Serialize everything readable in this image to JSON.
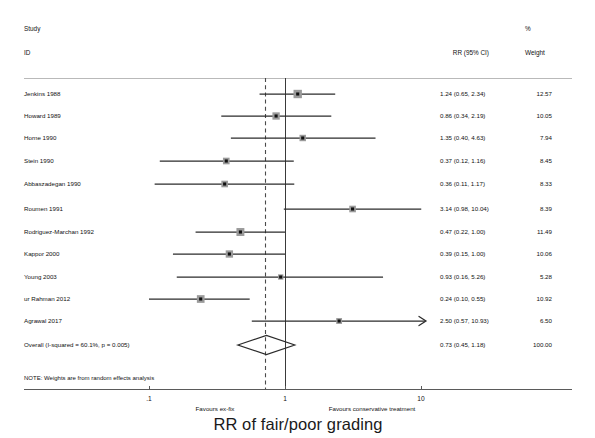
{
  "figure": {
    "title": "RR of fair/poor grading",
    "type": "forest-plot",
    "note": "NOTE: Weights are from random effects analysis",
    "top_caption": ""
  },
  "header": {
    "study_line1": "Study",
    "study_line2": "ID",
    "effect_label": "RR (95% CI)",
    "weight_line1": "%",
    "weight_line2": "Weight"
  },
  "axis": {
    "label_left": "Favours ex-fix",
    "label_right": "Favours conservative treatment",
    "scale": "log10",
    "ticks": [
      {
        "label": ".1",
        "value": 0.1,
        "x": 149
      },
      {
        "label": "1",
        "value": 1,
        "x": 285
      },
      {
        "label": "10",
        "value": 10,
        "x": 421
      }
    ],
    "x_min": 0.1,
    "x_max": 10,
    "null_line_value": 1,
    "pooled_line_value": 0.73,
    "axis_y": 389,
    "line_start_x": 24,
    "line_end_x": 572
  },
  "chart_data": {
    "type": "forest",
    "title": "RR of fair/poor grading",
    "xlabel": "RR (95% CI)",
    "ylabel": "",
    "xscale": "log",
    "xlim": [
      0.1,
      10
    ],
    "xticks": [
      0.1,
      1,
      10
    ],
    "xticklabels": [
      ".1",
      "1",
      "10"
    ],
    "grid": false,
    "columns": [
      "Study ID",
      "RR (95% CI)",
      "% Weight"
    ],
    "studies": [
      {
        "id": "Jenkins 1988",
        "rr": 1.24,
        "lo": 0.65,
        "hi": 2.34,
        "ci_text": "1.24 (0.65, 2.34)",
        "weight": 12.57,
        "weight_text": "12.57",
        "clipped": false
      },
      {
        "id": "Howard 1989",
        "rr": 0.86,
        "lo": 0.34,
        "hi": 2.19,
        "ci_text": "0.86 (0.34, 2.19)",
        "weight": 10.05,
        "weight_text": "10.05",
        "clipped": false
      },
      {
        "id": "Horne 1990",
        "rr": 1.35,
        "lo": 0.4,
        "hi": 4.63,
        "ci_text": "1.35 (0.40, 4.63)",
        "weight": 7.94,
        "weight_text": "7.94",
        "clipped": false
      },
      {
        "id": "Stein 1990",
        "rr": 0.37,
        "lo": 0.12,
        "hi": 1.16,
        "ci_text": "0.37 (0.12, 1.16)",
        "weight": 8.45,
        "weight_text": "8.45",
        "clipped": false
      },
      {
        "id": "Abbaszadegan 1990",
        "rr": 0.36,
        "lo": 0.11,
        "hi": 1.17,
        "ci_text": "0.36 (0.11, 1.17)",
        "weight": 8.33,
        "weight_text": "8.33",
        "clipped": false
      },
      {
        "id": "Roumen 1991",
        "rr": 3.14,
        "lo": 0.98,
        "hi": 10.04,
        "ci_text": "3.14 (0.98, 10.04)",
        "weight": 8.39,
        "weight_text": "8.39",
        "clipped": false
      },
      {
        "id": "Rodriguez-Marchan 1992",
        "rr": 0.47,
        "lo": 0.22,
        "hi": 1.0,
        "ci_text": "0.47 (0.22, 1.00)",
        "weight": 11.49,
        "weight_text": "11.49",
        "clipped": false
      },
      {
        "id": "Kappor 2000",
        "rr": 0.39,
        "lo": 0.15,
        "hi": 1.0,
        "ci_text": "0.39 (0.15, 1.00)",
        "weight": 10.06,
        "weight_text": "10.06",
        "clipped": false
      },
      {
        "id": "Young 2003",
        "rr": 0.93,
        "lo": 0.16,
        "hi": 5.26,
        "ci_text": "0.93 (0.16, 5.26)",
        "weight": 5.28,
        "weight_text": "5.28",
        "clipped": false
      },
      {
        "id": "ur Rahman 2012",
        "rr": 0.24,
        "lo": 0.1,
        "hi": 0.55,
        "ci_text": "0.24 (0.10, 0.55)",
        "weight": 10.92,
        "weight_text": "10.92",
        "clipped": false
      },
      {
        "id": "Agrawal 2017",
        "rr": 2.5,
        "lo": 0.57,
        "hi": 10.93,
        "ci_text": "2.50 (0.57, 10.93)",
        "weight": 6.5,
        "weight_text": "6.50",
        "clipped": true
      }
    ],
    "overall": {
      "id": "Overall  (I-squared = 60.1%, p = 0.005)",
      "rr": 0.73,
      "lo": 0.45,
      "hi": 1.18,
      "ci_text": "0.73 (0.45, 1.18)",
      "weight": 100.0,
      "weight_text": "100.00",
      "i_squared": "60.1%",
      "p_value": "0.005"
    }
  },
  "layout": {
    "row_y": [
      94,
      116,
      138,
      161,
      184,
      209,
      232,
      254,
      277,
      299,
      321
    ],
    "overall_y": 345,
    "label_x": 24,
    "ci_text_x": 440,
    "weight_x": 552,
    "header_y1": 26,
    "header_y2": 50,
    "rule_y": 78,
    "note_y": 378
  },
  "colors": {
    "marker_fill": "#9a9a9a",
    "marker_dot": "#101010",
    "line": "#2b2b2b",
    "rule": "#b9b9b9",
    "axis": "#5a5a5a",
    "text": "#111111",
    "null_line": "#3a3a3a",
    "pooled_line": "#4a4a4a"
  }
}
